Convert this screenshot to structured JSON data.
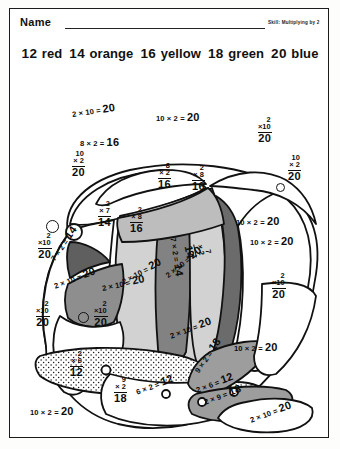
{
  "header": {
    "name_label": "Name",
    "skill": "Skill: Multiplying by 2"
  },
  "key": {
    "items": [
      {
        "number": "12",
        "color": "red"
      },
      {
        "number": "14",
        "color": "orange"
      },
      {
        "number": "16",
        "color": "yellow"
      },
      {
        "number": "18",
        "color": "green"
      },
      {
        "number": "20",
        "color": "blue"
      }
    ]
  },
  "colors": {
    "red": "#4a4a4a",
    "orange": "#6e6e6e",
    "yellow": "#c9c9c9",
    "green": "#9a9a9a",
    "blue": "#ffffff",
    "outline": "#111111",
    "paper": "#ffffff"
  },
  "puzzle": {
    "subject": "fish",
    "problems": [
      {
        "id": "p1",
        "text": "2 × 10 =",
        "answer": "20",
        "style": "inline"
      },
      {
        "id": "p2",
        "text": "10 × 2 =",
        "answer": "20",
        "style": "inline"
      },
      {
        "id": "p3",
        "text": "8 × 2 =",
        "answer": "16",
        "style": "inline"
      },
      {
        "id": "p4",
        "top": "2",
        "bottom": "×10",
        "answer": "20",
        "style": "stack"
      },
      {
        "id": "p5",
        "top": "10",
        "bottom": "× 2",
        "answer": "20",
        "style": "stack"
      },
      {
        "id": "p6",
        "top": "10",
        "bottom": "× 2",
        "answer": "20",
        "style": "stack"
      },
      {
        "id": "p7",
        "top": "8",
        "bottom": "× 2",
        "answer": "16",
        "style": "stack"
      },
      {
        "id": "p8",
        "top": "2",
        "bottom": "× 8",
        "answer": "16",
        "style": "stack"
      },
      {
        "id": "p9",
        "top": "2",
        "bottom": "× 8",
        "answer": "16",
        "style": "stack"
      },
      {
        "id": "p10",
        "top": "2",
        "bottom": "× 7",
        "answer": "14",
        "style": "stack"
      },
      {
        "id": "p11",
        "top": "7",
        "bottom": "× 2",
        "answer": "14",
        "style": "stack"
      },
      {
        "id": "p12",
        "text": "7 × 2 =",
        "answer": "14",
        "style": "inline"
      },
      {
        "id": "p13",
        "text": "7 × 2 =",
        "answer": "14",
        "style": "inline"
      },
      {
        "id": "p14",
        "top": "2",
        "bottom": "×10",
        "answer": "20",
        "style": "stack"
      },
      {
        "id": "p15",
        "top": "2",
        "bottom": "×10",
        "answer": "20",
        "style": "stack"
      },
      {
        "id": "p16",
        "top": "2",
        "bottom": "×10",
        "answer": "20",
        "style": "stack"
      },
      {
        "id": "p17",
        "top": "2",
        "bottom": "×10",
        "answer": "20",
        "style": "stack"
      },
      {
        "id": "p18",
        "text": "2 × 10 =",
        "answer": "20",
        "style": "inline"
      },
      {
        "id": "p19",
        "text": "2 × 10 =",
        "answer": "20",
        "style": "inline"
      },
      {
        "id": "p20",
        "text": "2 × 10 =",
        "answer": "20",
        "style": "inline"
      },
      {
        "id": "p21",
        "text": "10 × 2 =",
        "answer": "20",
        "style": "inline"
      },
      {
        "id": "p22",
        "text": "10 × 2 =",
        "answer": "20",
        "style": "inline"
      },
      {
        "id": "p23",
        "text": "10 × 2 =",
        "answer": "20",
        "style": "inline"
      },
      {
        "id": "p24",
        "text": "2 × 10 =",
        "answer": "20",
        "style": "inline"
      },
      {
        "id": "p25",
        "top": "2",
        "bottom": "× 6",
        "answer": "12",
        "style": "stack"
      },
      {
        "id": "p26",
        "text": "6 × 2 =",
        "answer": "12",
        "style": "inline"
      },
      {
        "id": "p27",
        "text": "2 × 6 =",
        "answer": "12",
        "style": "inline"
      },
      {
        "id": "p28",
        "top": "9",
        "bottom": "× 2",
        "answer": "18",
        "style": "stack"
      },
      {
        "id": "p29",
        "text": "9 × 2 =",
        "answer": "18",
        "style": "inline"
      },
      {
        "id": "p30",
        "text": "2 × 9 =",
        "answer": "18",
        "style": "inline"
      },
      {
        "id": "p31",
        "text": "2 × 10 =",
        "answer": "20",
        "style": "inline"
      },
      {
        "id": "p32",
        "text": "10 × 2 =",
        "answer": "20",
        "style": "inline"
      },
      {
        "id": "p33",
        "text": "2 × 10 =",
        "answer": "20",
        "style": "inline"
      }
    ]
  }
}
